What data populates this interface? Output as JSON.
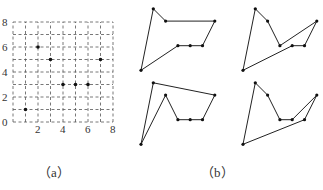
{
  "figure_a": {
    "caption": "（a）",
    "grid": {
      "xmin": 0,
      "xmax": 8,
      "ymin": 0,
      "ymax": 8
    },
    "x_ticks": [
      "0",
      "2",
      "4",
      "6",
      "8"
    ],
    "y_ticks": [
      "0",
      "2",
      "4",
      "6",
      "8"
    ],
    "points": [
      {
        "x": 1,
        "y": 1
      },
      {
        "x": 2,
        "y": 6
      },
      {
        "x": 3,
        "y": 5
      },
      {
        "x": 4,
        "y": 3
      },
      {
        "x": 5,
        "y": 3
      },
      {
        "x": 6,
        "y": 3
      },
      {
        "x": 7,
        "y": 5
      }
    ]
  },
  "figure_b": {
    "caption": "（b）",
    "polygons": [
      {
        "name": "polygon-1",
        "order": [
          [
            2,
            6
          ],
          [
            3,
            5
          ],
          [
            7,
            5
          ],
          [
            6,
            3
          ],
          [
            5,
            3
          ],
          [
            4,
            3
          ],
          [
            1,
            1
          ]
        ]
      },
      {
        "name": "polygon-2",
        "order": [
          [
            2,
            6
          ],
          [
            3,
            5
          ],
          [
            4,
            3
          ],
          [
            7,
            5
          ],
          [
            6,
            3
          ],
          [
            5,
            3
          ],
          [
            1,
            1
          ]
        ]
      },
      {
        "name": "polygon-3",
        "order": [
          [
            2,
            6
          ],
          [
            7,
            5
          ],
          [
            6,
            3
          ],
          [
            5,
            3
          ],
          [
            4,
            3
          ],
          [
            3,
            5
          ],
          [
            1,
            1
          ]
        ]
      },
      {
        "name": "polygon-4",
        "order": [
          [
            2,
            6
          ],
          [
            3,
            5
          ],
          [
            4,
            3
          ],
          [
            5,
            3
          ],
          [
            7,
            5
          ],
          [
            6,
            3
          ],
          [
            1,
            1
          ]
        ]
      }
    ]
  }
}
